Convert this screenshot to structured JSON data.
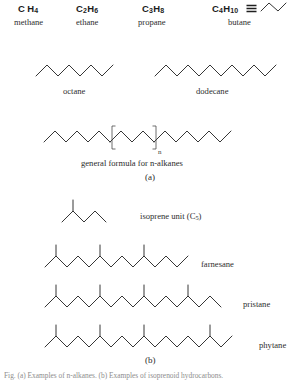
{
  "figure": {
    "panel_a_label": "(a)",
    "panel_b_label": "(b)",
    "general_formula_caption": "general formula for n-alkanes",
    "repeat_subscript": "n",
    "footer_note": "Fig. (a) Examples of n-alkanes. (b) Examples of isoprenoid hydrocarbons."
  },
  "short_alkanes": [
    {
      "formula_c": "C",
      "formula_c_sub": "",
      "formula_h": "H",
      "formula_h_sub": "4",
      "formula_c_num": "",
      "name": "methane",
      "x": 18,
      "y": 4
    },
    {
      "formula_c": "C",
      "formula_c_sub": "2",
      "formula_h": "H",
      "formula_h_sub": "6",
      "name": "ethane",
      "x": 76,
      "y": 4
    },
    {
      "formula_c": "C",
      "formula_c_sub": "3",
      "formula_h": "H",
      "formula_h_sub": "8",
      "name": "propane",
      "x": 140,
      "y": 4
    },
    {
      "formula_c": "C",
      "formula_c_sub": "4",
      "formula_h": "H",
      "formula_h_sub": "10",
      "name": "butane",
      "x": 212,
      "y": 4
    }
  ],
  "labels": {
    "methane_formula": "CH4",
    "ethane_formula": "C2H6",
    "propane_formula": "C3H8",
    "butane_formula": "C4H10",
    "methane_name": "methane",
    "ethane_name": "ethane",
    "propane_name": "propane",
    "butane_name": "butane",
    "octane_name": "octane",
    "dodecane_name": "dodecane",
    "isoprene_name": "isoprene unit (C5)",
    "isoprene_name_main": "isoprene unit  (C",
    "isoprene_name_sub": "5",
    "isoprene_name_tail": ")",
    "farnesane_name": "farnesane",
    "pristane_name": "pristane",
    "phytane_name": "phytane"
  },
  "structures": {
    "butane": {
      "name": "butane",
      "vertices": [
        [
          0,
          11
        ],
        [
          8,
          3
        ],
        [
          17,
          11
        ],
        [
          25,
          3
        ]
      ],
      "width": 30,
      "height": 16
    },
    "octane": {
      "name": "octane",
      "carbon_count": 8,
      "vertices": [
        [
          0,
          14
        ],
        [
          11,
          3
        ],
        [
          22,
          14
        ],
        [
          33,
          3
        ],
        [
          44,
          14
        ],
        [
          55,
          3
        ],
        [
          66,
          14
        ],
        [
          77,
          3
        ]
      ],
      "width": 82,
      "height": 18
    },
    "dodecane": {
      "name": "dodecane",
      "carbon_count": 12,
      "vertices": [
        [
          0,
          14
        ],
        [
          11,
          3
        ],
        [
          22,
          14
        ],
        [
          33,
          3
        ],
        [
          44,
          14
        ],
        [
          55,
          3
        ],
        [
          66,
          14
        ],
        [
          77,
          3
        ],
        [
          88,
          14
        ],
        [
          99,
          3
        ],
        [
          110,
          14
        ],
        [
          121,
          3
        ]
      ],
      "width": 126,
      "height": 18
    },
    "general_formula": {
      "name": "general formula for n-alkanes",
      "left_chain": [
        [
          0,
          14
        ],
        [
          11,
          3
        ],
        [
          22,
          14
        ],
        [
          33,
          3
        ],
        [
          44,
          14
        ],
        [
          55,
          3
        ],
        [
          66,
          14
        ]
      ],
      "repeat_chain": [
        [
          66,
          14
        ],
        [
          77,
          3
        ],
        [
          88,
          14
        ],
        [
          99,
          3
        ],
        [
          110,
          14
        ]
      ],
      "right_chain": [
        [
          110,
          14
        ],
        [
          121,
          3
        ],
        [
          132,
          14
        ],
        [
          143,
          3
        ],
        [
          154,
          14
        ],
        [
          165,
          3
        ],
        [
          176,
          14
        ],
        [
          187,
          3
        ]
      ],
      "bracket_left_x": 68,
      "bracket_right_x": 112,
      "bracket_top": -2,
      "bracket_bottom": 21,
      "bracket_tab": 3.5,
      "width": 192,
      "height": 26
    },
    "isoprene": {
      "name": "isoprene unit (C5)",
      "vertices": [
        [
          0,
          14
        ],
        [
          11,
          3
        ],
        [
          22,
          14
        ],
        [
          33,
          3
        ],
        [
          44,
          14
        ]
      ],
      "branches": [
        [
          [
            11,
            3
          ],
          [
            11,
            -8
          ]
        ]
      ],
      "width": 48,
      "height": 24
    },
    "farnesane": {
      "name": "farnesane",
      "vertices": [
        [
          0,
          14
        ],
        [
          11,
          3
        ],
        [
          22,
          14
        ],
        [
          33,
          3
        ],
        [
          44,
          14
        ],
        [
          55,
          3
        ],
        [
          66,
          14
        ],
        [
          77,
          3
        ],
        [
          88,
          14
        ],
        [
          99,
          3
        ],
        [
          110,
          14
        ],
        [
          121,
          3
        ],
        [
          132,
          14
        ],
        [
          143,
          3
        ]
      ],
      "branches": [
        [
          [
            11,
            3
          ],
          [
            11,
            -8
          ]
        ],
        [
          [
            55,
            3
          ],
          [
            55,
            -8
          ]
        ],
        [
          [
            99,
            3
          ],
          [
            99,
            -8
          ]
        ]
      ],
      "width": 148,
      "height": 24
    },
    "pristane": {
      "name": "pristane",
      "vertices": [
        [
          0,
          14
        ],
        [
          11,
          3
        ],
        [
          22,
          14
        ],
        [
          33,
          3
        ],
        [
          44,
          14
        ],
        [
          55,
          3
        ],
        [
          66,
          14
        ],
        [
          77,
          3
        ],
        [
          88,
          14
        ],
        [
          99,
          3
        ],
        [
          110,
          14
        ],
        [
          121,
          3
        ],
        [
          132,
          14
        ],
        [
          143,
          3
        ],
        [
          154,
          14
        ],
        [
          165,
          3
        ],
        [
          176,
          14
        ]
      ],
      "branches": [
        [
          [
            11,
            3
          ],
          [
            11,
            -8
          ]
        ],
        [
          [
            55,
            3
          ],
          [
            55,
            -8
          ]
        ],
        [
          [
            99,
            3
          ],
          [
            99,
            -8
          ]
        ],
        [
          [
            143,
            3
          ],
          [
            143,
            -8
          ]
        ]
      ],
      "width": 180,
      "height": 24
    },
    "phytane": {
      "name": "phytane",
      "vertices": [
        [
          0,
          14
        ],
        [
          11,
          3
        ],
        [
          22,
          14
        ],
        [
          33,
          3
        ],
        [
          44,
          14
        ],
        [
          55,
          3
        ],
        [
          66,
          14
        ],
        [
          77,
          3
        ],
        [
          88,
          14
        ],
        [
          99,
          3
        ],
        [
          110,
          14
        ],
        [
          121,
          3
        ],
        [
          132,
          14
        ],
        [
          143,
          3
        ],
        [
          154,
          14
        ],
        [
          165,
          3
        ],
        [
          176,
          14
        ],
        [
          187,
          3
        ]
      ],
      "branches": [
        [
          [
            11,
            3
          ],
          [
            11,
            -8
          ]
        ],
        [
          [
            55,
            3
          ],
          [
            55,
            -8
          ]
        ],
        [
          [
            99,
            3
          ],
          [
            99,
            -8
          ]
        ],
        [
          [
            165,
            3
          ],
          [
            165,
            -8
          ]
        ]
      ],
      "width": 192,
      "height": 24
    }
  }
}
